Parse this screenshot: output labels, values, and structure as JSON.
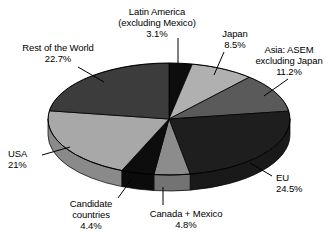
{
  "chart_data": {
    "type": "pie",
    "title": "",
    "subtitle": "",
    "xlabel": "",
    "ylabel": "",
    "legend_position": "labels-with-leader-lines",
    "grid": false,
    "three_d": true,
    "categories": [
      "Latin America (excluding Mexico)",
      "Japan",
      "Asia: ASEM excluding Japan",
      "EU",
      "Canada + Mexico",
      "Candidate countries",
      "USA",
      "Rest of the World"
    ],
    "values": [
      3.1,
      8.5,
      11.2,
      24.5,
      4.8,
      4.4,
      21,
      22.7
    ],
    "value_labels": [
      "3.1%",
      "8.5%",
      "11.2%",
      "24.5%",
      "4.8%",
      "4.4%",
      "21%",
      "22.7%"
    ],
    "colors": [
      "#0d0d0d",
      "#b0b0b0",
      "#5a5a5a",
      "#1e1e1e",
      "#8c8c8c",
      "#0d0d0d",
      "#a8a8a8",
      "#3c3c3c"
    ]
  },
  "labels": {
    "latin_america": {
      "line1": "Latin America",
      "line2": "(excluding Mexico)",
      "line3": "3.1%"
    },
    "japan": {
      "line1": "Japan",
      "line2": "8.5%"
    },
    "asia_asem": {
      "line1": "Asia: ASEM",
      "line2": "excluding Japan",
      "line3": "11.2%"
    },
    "rest_of_world": {
      "line1": "Rest of the World",
      "line2": "22.7%"
    },
    "usa": {
      "line1": "USA",
      "line2": "21%"
    },
    "eu": {
      "line1": "EU",
      "line2": "24.5%"
    },
    "candidate_countries": {
      "line1": "Candidate",
      "line2": "countries",
      "line3": "4.4%"
    },
    "canada_mexico": {
      "line1": "Canada + Mexico",
      "line2": "4.8%"
    }
  }
}
